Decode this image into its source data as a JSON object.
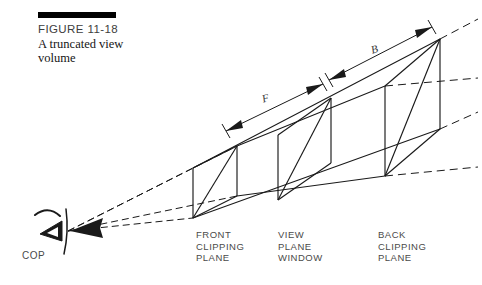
{
  "figure": {
    "number_label": "FIGURE 11-18",
    "title": "A truncated view volume",
    "rule_color": "#000000"
  },
  "diagram": {
    "type": "perspective-view-frustum",
    "stroke_color": "#1a1a1a",
    "dashed_color": "#1a1a1a",
    "background": "#ffffff",
    "viewer": {
      "name": "center-of-projection",
      "label": "COP",
      "apex_x": 68,
      "apex_y": 231
    },
    "planes": [
      {
        "id": "front-clipping-plane",
        "label": "FRONT\nCLIPPING\nPLANE",
        "label_x": 196,
        "label_y": 229,
        "corners": {
          "bottom_left": [
            193,
            218
          ],
          "bottom_right": [
            237,
            196
          ],
          "top_right": [
            237,
            146
          ],
          "top_left": [
            193,
            168
          ]
        }
      },
      {
        "id": "view-plane-window",
        "label": "VIEW\nPLANE\nWINDOW",
        "label_x": 278,
        "label_y": 229,
        "corners": {
          "bottom_left": [
            278,
            200
          ],
          "bottom_right": [
            331,
            163
          ],
          "top_right": [
            331,
            98
          ],
          "top_left": [
            278,
            135
          ]
        }
      },
      {
        "id": "back-clipping-plane",
        "label": "BACK\nCLIPPING\nPLANE",
        "label_x": 378,
        "label_y": 229,
        "corners": {
          "bottom_left": [
            385,
            176
          ],
          "bottom_right": [
            440,
            129
          ],
          "top_right": [
            440,
            39
          ],
          "top_left": [
            385,
            86
          ]
        }
      }
    ],
    "dimensions": [
      {
        "id": "near-distance",
        "letter": "F",
        "from": [
          226,
          131
        ],
        "to": [
          323,
          84
        ],
        "letter_x": 262,
        "letter_y": 92,
        "rotation_deg": -17
      },
      {
        "id": "far-distance",
        "letter": "B",
        "from": [
          329,
          80
        ],
        "to": [
          432,
          27
        ],
        "letter_x": 371,
        "letter_y": 43,
        "rotation_deg": -17
      }
    ]
  }
}
